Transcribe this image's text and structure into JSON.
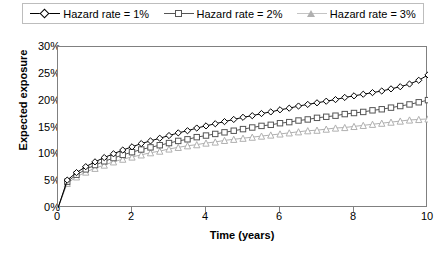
{
  "legend": {
    "position": "top",
    "entries": [
      {
        "label": "Hazard rate = 1%",
        "marker": "diamond-marker",
        "color": "#000000"
      },
      {
        "label": "Hazard rate = 2%",
        "marker": "square-marker",
        "color": "#555555"
      },
      {
        "label": "Hazard rate = 3%",
        "marker": "triangle-marker",
        "color": "#b0b0b0"
      }
    ]
  },
  "chart_data": {
    "type": "line",
    "title": "",
    "xlabel": "Time (years)",
    "ylabel": "Expected exposure",
    "xlim": [
      0,
      10
    ],
    "ylim": [
      0,
      0.3
    ],
    "grid": false,
    "x_ticks": [
      "0",
      "2",
      "4",
      "6",
      "8",
      "10"
    ],
    "x_tick_values": [
      0,
      2,
      4,
      6,
      8,
      10
    ],
    "y_ticks": [
      "0%",
      "5%",
      "10%",
      "15%",
      "20%",
      "25%",
      "30%"
    ],
    "y_tick_values": [
      0,
      5,
      10,
      15,
      20,
      25,
      30
    ],
    "x": [
      0,
      0.25,
      0.5,
      0.75,
      1,
      1.25,
      1.5,
      1.75,
      2,
      2.25,
      2.5,
      2.75,
      3,
      3.25,
      3.5,
      3.75,
      4,
      4.25,
      4.5,
      4.75,
      5,
      5.25,
      5.5,
      5.75,
      6,
      6.25,
      6.5,
      6.75,
      7,
      7.25,
      7.5,
      7.75,
      8,
      8.25,
      8.5,
      8.75,
      9,
      9.25,
      9.5,
      9.75,
      10
    ],
    "series": [
      {
        "name": "Hazard rate = 1%",
        "marker": "diamond-marker",
        "color": "#000000",
        "values": [
          0.0,
          5.2,
          6.6,
          7.7,
          8.6,
          9.4,
          10.1,
          10.8,
          11.4,
          12.0,
          12.5,
          13.0,
          13.5,
          14.0,
          14.4,
          14.9,
          15.3,
          15.7,
          16.1,
          16.5,
          16.9,
          17.2,
          17.6,
          17.9,
          18.3,
          18.6,
          19.0,
          19.3,
          19.6,
          19.9,
          20.2,
          20.6,
          20.9,
          21.2,
          21.5,
          21.8,
          22.2,
          22.6,
          23.1,
          23.8,
          24.8
        ]
      },
      {
        "name": "Hazard rate = 2%",
        "marker": "square-marker",
        "color": "#555555",
        "values": [
          0.0,
          4.9,
          6.2,
          7.2,
          8.0,
          8.7,
          9.3,
          9.9,
          10.4,
          10.9,
          11.3,
          11.7,
          12.1,
          12.5,
          12.8,
          13.2,
          13.5,
          13.8,
          14.1,
          14.4,
          14.7,
          15.0,
          15.3,
          15.5,
          15.8,
          16.0,
          16.3,
          16.5,
          16.8,
          17.0,
          17.2,
          17.5,
          17.7,
          17.9,
          18.2,
          18.4,
          18.7,
          19.0,
          19.3,
          19.7,
          20.1
        ]
      },
      {
        "name": "Hazard rate = 3%",
        "marker": "triangle-marker",
        "color": "#b0b0b0",
        "values": [
          0.0,
          4.6,
          5.8,
          6.7,
          7.4,
          8.0,
          8.6,
          9.1,
          9.5,
          9.9,
          10.3,
          10.6,
          11.0,
          11.3,
          11.6,
          11.8,
          12.1,
          12.3,
          12.6,
          12.8,
          13.0,
          13.2,
          13.4,
          13.6,
          13.8,
          14.0,
          14.2,
          14.4,
          14.5,
          14.7,
          14.9,
          15.0,
          15.2,
          15.4,
          15.6,
          15.8,
          16.0,
          16.2,
          16.4,
          16.5,
          16.6
        ]
      }
    ]
  }
}
